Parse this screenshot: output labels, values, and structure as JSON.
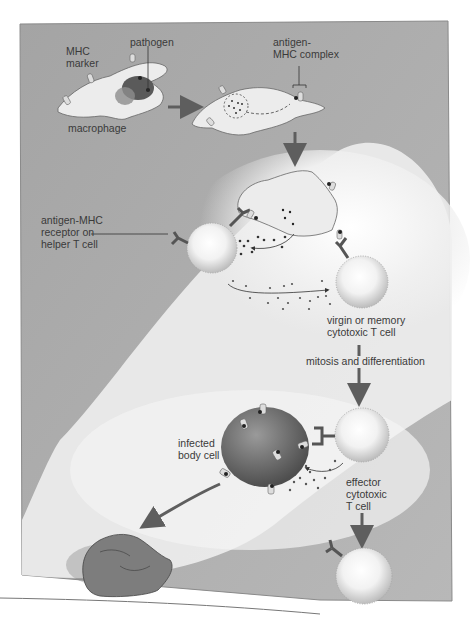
{
  "diagram": {
    "type": "biology-illustration",
    "colors": {
      "panel_bg": "#a8a8a8",
      "panel_light": "#f4f4f4",
      "cell_fill": "#ececec",
      "infected_cell": "#6a6a6a",
      "arrow": "#5e5e5e",
      "label": "#3a3a3a"
    },
    "labels": {
      "mhc_marker": "MHC\nmarker",
      "pathogen": "pathogen",
      "antigen_mhc_complex": "antigen-\nMHC complex",
      "macrophage": "macrophage",
      "receptor": "antigen-MHC\nreceptor on\nhelper T cell",
      "virgin_memory": "virgin or memory\ncytotoxic T cell",
      "mitosis": "mitosis and differentiation",
      "infected": "infected\nbody cell",
      "effector": "effector\ncytotoxic\nT cell"
    },
    "nodes": [
      {
        "id": "macrophage-engulfing",
        "label": "macrophage"
      },
      {
        "id": "macrophage-presenting",
        "label": "antigen-MHC complex"
      },
      {
        "id": "macrophage-activating"
      },
      {
        "id": "helper-t-cell",
        "label": "antigen-MHC receptor on helper T cell"
      },
      {
        "id": "cytotoxic-t-cell",
        "label": "virgin or memory cytotoxic T cell"
      },
      {
        "id": "effector-t-cell",
        "label": "effector cytotoxic T cell"
      },
      {
        "id": "infected-body-cell",
        "label": "infected body cell"
      },
      {
        "id": "dead-cell"
      },
      {
        "id": "memory-t-cell"
      }
    ],
    "edges": [
      {
        "from": "macrophage-engulfing",
        "to": "macrophage-presenting"
      },
      {
        "from": "macrophage-presenting",
        "to": "macrophage-activating"
      },
      {
        "from": "macrophage-activating",
        "to": "helper-t-cell"
      },
      {
        "from": "helper-t-cell",
        "to": "cytotoxic-t-cell"
      },
      {
        "from": "cytotoxic-t-cell",
        "to": "effector-t-cell",
        "label": "mitosis and differentiation"
      },
      {
        "from": "effector-t-cell",
        "to": "infected-body-cell"
      },
      {
        "from": "infected-body-cell",
        "to": "dead-cell"
      },
      {
        "from": "effector-t-cell",
        "to": "memory-t-cell"
      }
    ]
  }
}
